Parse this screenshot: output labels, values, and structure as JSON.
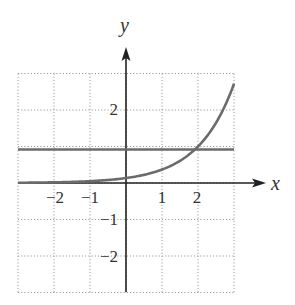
{
  "chart_data": {
    "type": "line",
    "title": "",
    "xlabel": "x",
    "ylabel": "y",
    "xlim": [
      -3,
      3
    ],
    "ylim": [
      -3,
      3
    ],
    "grid": true,
    "grid_style": "dotted",
    "x_ticks": [
      -2,
      -1,
      1,
      2
    ],
    "y_ticks": [
      2,
      -1,
      -2
    ],
    "x_tick_labels": [
      "−2",
      "−1",
      "1",
      "2"
    ],
    "y_tick_labels": [
      "2",
      "−1",
      "−2"
    ],
    "series": [
      {
        "name": "exponential curve",
        "description": "y = e^(x-2)",
        "x": [
          -3,
          -2,
          -1,
          0,
          0.5,
          1,
          1.5,
          2,
          2.5,
          3
        ],
        "y": [
          0.007,
          0.018,
          0.05,
          0.135,
          0.223,
          0.368,
          0.607,
          1.0,
          1.649,
          2.718
        ],
        "color": "#6b6b6b"
      },
      {
        "name": "horizontal line",
        "description": "y = 1",
        "x": [
          -3,
          3
        ],
        "y": [
          1,
          1
        ],
        "color": "#6b6b6b"
      }
    ],
    "annotations": []
  },
  "labels": {
    "x_axis": "x",
    "y_axis": "y",
    "xt_m2": "−2",
    "xt_m1": "−1",
    "xt_1": "1",
    "xt_2": "2",
    "yt_2": "2",
    "yt_m1": "−1",
    "yt_m2": "−2"
  },
  "colors": {
    "axis": "#222222",
    "grid": "#9a9a9a",
    "curve": "#6b6b6b"
  }
}
